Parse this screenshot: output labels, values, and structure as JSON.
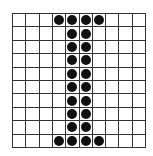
{
  "grid": {
    "rows": 10,
    "cols": 10,
    "line_color": "#333333",
    "dot_color": "#111111",
    "filled": [
      [
        0,
        3
      ],
      [
        0,
        4
      ],
      [
        0,
        5
      ],
      [
        0,
        6
      ],
      [
        1,
        4
      ],
      [
        1,
        5
      ],
      [
        2,
        4
      ],
      [
        2,
        5
      ],
      [
        3,
        4
      ],
      [
        3,
        5
      ],
      [
        4,
        4
      ],
      [
        4,
        5
      ],
      [
        5,
        4
      ],
      [
        5,
        5
      ],
      [
        6,
        4
      ],
      [
        6,
        5
      ],
      [
        7,
        4
      ],
      [
        7,
        5
      ],
      [
        8,
        4
      ],
      [
        8,
        5
      ],
      [
        9,
        3
      ],
      [
        9,
        4
      ],
      [
        9,
        5
      ],
      [
        9,
        6
      ]
    ]
  }
}
